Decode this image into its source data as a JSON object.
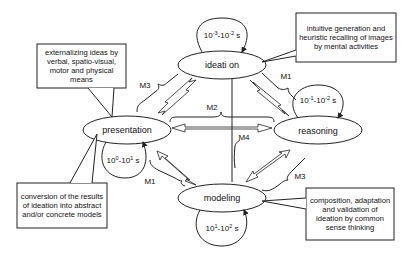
{
  "nodes": {
    "ideation": {
      "label": "ideati on",
      "time_base1": "10",
      "time_exp1": "-3",
      "time_sep": "-",
      "time_base2": "10",
      "time_exp2": "-2",
      "time_unit": " s"
    },
    "presentation": {
      "label": "presentation",
      "time_base1": "10",
      "time_exp1": "0",
      "time_sep": "-",
      "time_base2": "10",
      "time_exp2": "1",
      "time_unit": " s"
    },
    "reasoning": {
      "label": "reasoning",
      "time_base1": "10",
      "time_exp1": "-1",
      "time_sep": "-",
      "time_base2": "10",
      "time_exp2": "-2",
      "time_unit": " s"
    },
    "modeling": {
      "label": "modeling",
      "time_base1": "10",
      "time_exp1": "1",
      "time_sep": "-",
      "time_base2": "10",
      "time_exp2": "2",
      "time_unit": " s"
    }
  },
  "mechanisms": {
    "m1_top": "M1",
    "m1_bottom": "M1",
    "m2": "M2",
    "m3_top": "M3",
    "m3_bottom": "M3",
    "m4": "M4"
  },
  "callouts": {
    "presentation": "externalizing ideas by verbal, spatio-visual, motor and physical means",
    "ideation": "intuitive generation and heuristic recalling of images by mental activities",
    "modeling_conversion": "conversion of the results of ideation into abstract and/or concrete models",
    "reasoning": "composition, adaptation and validation of ideation by common sense thinking"
  },
  "colors": {
    "stroke": "#222222",
    "background": "#ffffff"
  }
}
